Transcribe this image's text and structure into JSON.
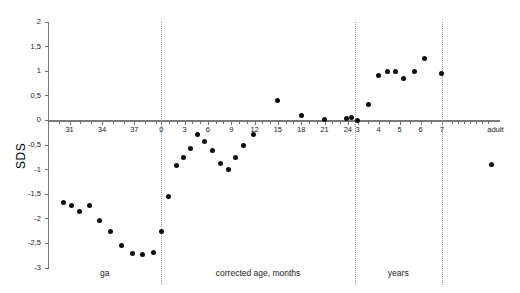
{
  "chart_data": {
    "type": "scatter",
    "title": "",
    "xlabel": "",
    "ylabel": "SDS",
    "ylim": [
      -3,
      2
    ],
    "grid": false,
    "legend": null,
    "y_ticks": [
      2,
      1.5,
      1,
      0.5,
      0,
      -0.5,
      -1,
      -1.5,
      -2,
      -2.5,
      -3
    ],
    "y_tick_labels": [
      "2",
      "1,5",
      "1",
      "0,5",
      "0",
      "-0,5",
      "-1",
      "-1,5",
      "-2",
      "-2,5",
      "-3"
    ],
    "x_segments": [
      {
        "name": "ga",
        "label": "ga",
        "unit": "weeks",
        "tick_labels": [
          "31",
          "34",
          "37"
        ],
        "tick_values": [
          31,
          34,
          37
        ]
      },
      {
        "name": "corrected-age",
        "label": "corrected age, months",
        "unit": "months",
        "tick_labels": [
          "0",
          "3",
          "6",
          "9",
          "12",
          "15",
          "18",
          "21",
          "24"
        ],
        "tick_values": [
          0,
          3,
          6,
          9,
          12,
          15,
          18,
          21,
          24
        ]
      },
      {
        "name": "years",
        "label": "years",
        "unit": "years",
        "tick_labels": [
          "3",
          "4",
          "5",
          "6",
          "7"
        ],
        "tick_values": [
          3,
          4,
          5,
          6,
          7
        ]
      },
      {
        "name": "adult",
        "label": "",
        "unit": "",
        "tick_labels": [
          "adult"
        ],
        "tick_values": [
          99
        ]
      }
    ],
    "dividers": [
      {
        "after_segment": "ga",
        "at_label": "0"
      },
      {
        "after_segment": "corrected-age",
        "at_label": "24"
      },
      {
        "after_segment": "years",
        "at_label": "7"
      }
    ],
    "series": [
      {
        "name": "SDS",
        "marker": "filled-circle",
        "color": "#0d0d0d",
        "points": [
          {
            "segment": "ga",
            "x": 30.4,
            "y": -1.67
          },
          {
            "segment": "ga",
            "x": 31.2,
            "y": -1.73
          },
          {
            "segment": "ga",
            "x": 31.9,
            "y": -1.85
          },
          {
            "segment": "ga",
            "x": 32.8,
            "y": -1.72
          },
          {
            "segment": "ga",
            "x": 33.8,
            "y": -2.03
          },
          {
            "segment": "ga",
            "x": 34.8,
            "y": -2.25
          },
          {
            "segment": "ga",
            "x": 35.8,
            "y": -2.55
          },
          {
            "segment": "ga",
            "x": 36.8,
            "y": -2.71
          },
          {
            "segment": "ga",
            "x": 37.8,
            "y": -2.72
          },
          {
            "segment": "ga",
            "x": 38.8,
            "y": -2.68
          },
          {
            "segment": "corrected-age",
            "x": 0.0,
            "y": -2.25
          },
          {
            "segment": "corrected-age",
            "x": 0.9,
            "y": -1.54
          },
          {
            "segment": "corrected-age",
            "x": 2.0,
            "y": -0.92
          },
          {
            "segment": "corrected-age",
            "x": 2.8,
            "y": -0.75
          },
          {
            "segment": "corrected-age",
            "x": 3.7,
            "y": -0.57
          },
          {
            "segment": "corrected-age",
            "x": 4.6,
            "y": -0.28
          },
          {
            "segment": "corrected-age",
            "x": 5.6,
            "y": -0.43
          },
          {
            "segment": "corrected-age",
            "x": 6.6,
            "y": -0.62
          },
          {
            "segment": "corrected-age",
            "x": 7.6,
            "y": -0.88
          },
          {
            "segment": "corrected-age",
            "x": 8.6,
            "y": -1.0
          },
          {
            "segment": "corrected-age",
            "x": 9.6,
            "y": -0.75
          },
          {
            "segment": "corrected-age",
            "x": 10.6,
            "y": -0.5
          },
          {
            "segment": "corrected-age",
            "x": 11.8,
            "y": -0.28
          },
          {
            "segment": "corrected-age",
            "x": 15.0,
            "y": 0.4
          },
          {
            "segment": "corrected-age",
            "x": 18.0,
            "y": 0.1
          },
          {
            "segment": "corrected-age",
            "x": 21.0,
            "y": 0.02
          },
          {
            "segment": "corrected-age",
            "x": 23.8,
            "y": 0.03
          },
          {
            "segment": "corrected-age",
            "x": 24.5,
            "y": 0.05
          },
          {
            "segment": "years",
            "x": 3.0,
            "y": 0.0
          },
          {
            "segment": "years",
            "x": 3.5,
            "y": 0.33
          },
          {
            "segment": "years",
            "x": 4.0,
            "y": 0.92
          },
          {
            "segment": "years",
            "x": 4.4,
            "y": 1.0
          },
          {
            "segment": "years",
            "x": 4.8,
            "y": 1.0
          },
          {
            "segment": "years",
            "x": 5.2,
            "y": 0.86
          },
          {
            "segment": "years",
            "x": 5.7,
            "y": 1.0
          },
          {
            "segment": "years",
            "x": 6.2,
            "y": 1.25
          },
          {
            "segment": "years",
            "x": 7.0,
            "y": 0.96
          },
          {
            "segment": "adult",
            "x": 99,
            "y": -0.9
          }
        ]
      }
    ]
  },
  "axis": {
    "y_title": "SDS"
  }
}
